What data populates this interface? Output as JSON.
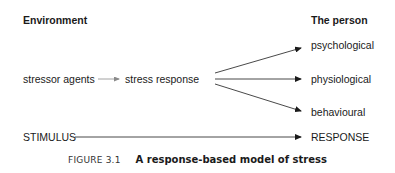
{
  "headers": {
    "left": "Environment",
    "right": "The person"
  },
  "nodes": {
    "stressor": "stressor agents",
    "stress_response": "stress response",
    "psychological": "psychological",
    "physiological": "physiological",
    "behavioural": "behavioural",
    "stimulus": "STIMULUS",
    "response": "RESPONSE"
  },
  "caption": {
    "number": "FIGURE 3.1",
    "title": "A response-based model of stress"
  },
  "colors": {
    "text": "#1a1a1a",
    "arrow": "#1a1a1a",
    "short_arrow": "#8a8a8a"
  }
}
